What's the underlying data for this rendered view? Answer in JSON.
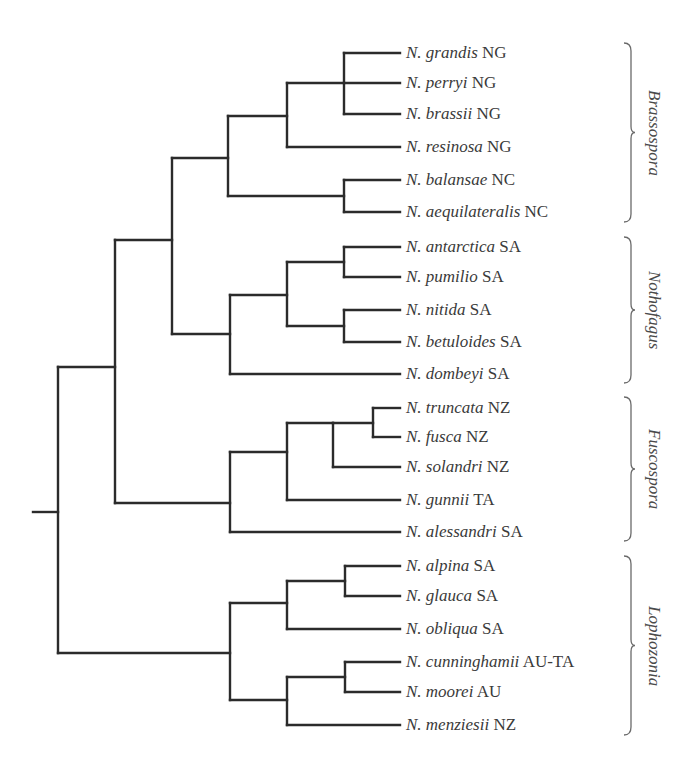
{
  "figure": {
    "type": "phylogenetic-tree",
    "genus_abbrev": "N."
  },
  "taxa": [
    {
      "species": "grandis",
      "region": "NG",
      "y": 53
    },
    {
      "species": "perryi",
      "region": "NG",
      "y": 83
    },
    {
      "species": "brassii",
      "region": "NG",
      "y": 114
    },
    {
      "species": "resinosa",
      "region": "NG",
      "y": 147
    },
    {
      "species": "balansae",
      "region": "NC",
      "y": 180
    },
    {
      "species": "aequilateralis",
      "region": "NC",
      "y": 212
    },
    {
      "species": "antarctica",
      "region": "SA",
      "y": 247
    },
    {
      "species": "pumilio",
      "region": "SA",
      "y": 277
    },
    {
      "species": "nitida",
      "region": "SA",
      "y": 310
    },
    {
      "species": "betuloides",
      "region": "SA",
      "y": 342
    },
    {
      "species": "dombeyi",
      "region": "SA",
      "y": 374
    },
    {
      "species": "truncata",
      "region": "NZ",
      "y": 408
    },
    {
      "species": "fusca",
      "region": "NZ",
      "y": 437
    },
    {
      "species": "solandri",
      "region": "NZ",
      "y": 467
    },
    {
      "species": "gunnii",
      "region": "TA",
      "y": 500
    },
    {
      "species": "alessandri",
      "region": "SA",
      "y": 532
    },
    {
      "species": "alpina",
      "region": "SA",
      "y": 566
    },
    {
      "species": "glauca",
      "region": "SA",
      "y": 596
    },
    {
      "species": "obliqua",
      "region": "SA",
      "y": 629
    },
    {
      "species": "cunninghamii",
      "region": "AU-TA",
      "y": 662
    },
    {
      "species": "moorei",
      "region": "AU",
      "y": 692
    },
    {
      "species": "menziesii",
      "region": "NZ",
      "y": 725
    }
  ],
  "groups": [
    {
      "name": "Brassospora",
      "top": 43,
      "bottom": 222
    },
    {
      "name": "Nothofagus",
      "top": 237,
      "bottom": 383
    },
    {
      "name": "Fuscospora",
      "top": 397,
      "bottom": 541
    },
    {
      "name": "Lophozonia",
      "top": 556,
      "bottom": 735
    }
  ],
  "branches": [
    [
      33,
      512,
      58,
      512
    ],
    [
      58,
      367,
      58,
      653
    ],
    [
      58,
      367,
      115,
      367
    ],
    [
      58,
      653,
      230,
      653
    ],
    [
      115,
      240,
      115,
      503
    ],
    [
      115,
      240,
      172,
      240
    ],
    [
      115,
      503,
      230,
      503
    ],
    [
      172,
      158,
      172,
      334
    ],
    [
      172,
      158,
      228,
      158
    ],
    [
      172,
      334,
      230,
      334
    ],
    [
      228,
      116,
      228,
      196
    ],
    [
      228,
      116,
      287,
      116
    ],
    [
      228,
      196,
      344,
      196
    ],
    [
      287,
      83,
      287,
      147
    ],
    [
      287,
      83,
      344,
      83
    ],
    [
      287,
      147,
      400,
      147
    ],
    [
      344,
      53,
      344,
      114
    ],
    [
      344,
      53,
      400,
      53
    ],
    [
      344,
      83,
      400,
      83
    ],
    [
      344,
      114,
      400,
      114
    ],
    [
      344,
      180,
      344,
      212
    ],
    [
      344,
      180,
      400,
      180
    ],
    [
      344,
      212,
      400,
      212
    ],
    [
      230,
      295,
      230,
      374
    ],
    [
      230,
      295,
      287,
      295
    ],
    [
      230,
      374,
      400,
      374
    ],
    [
      287,
      262,
      287,
      326
    ],
    [
      287,
      262,
      344,
      262
    ],
    [
      287,
      326,
      344,
      326
    ],
    [
      344,
      247,
      344,
      277
    ],
    [
      344,
      247,
      400,
      247
    ],
    [
      344,
      277,
      400,
      277
    ],
    [
      344,
      310,
      344,
      342
    ],
    [
      344,
      310,
      400,
      310
    ],
    [
      344,
      342,
      400,
      342
    ],
    [
      230,
      452,
      230,
      532
    ],
    [
      230,
      452,
      287,
      452
    ],
    [
      230,
      532,
      400,
      532
    ],
    [
      287,
      423,
      287,
      500
    ],
    [
      287,
      423,
      333,
      423
    ],
    [
      287,
      500,
      400,
      500
    ],
    [
      333,
      423,
      333,
      467
    ],
    [
      333,
      423,
      373,
      423
    ],
    [
      333,
      467,
      400,
      467
    ],
    [
      373,
      408,
      373,
      437
    ],
    [
      373,
      408,
      400,
      408
    ],
    [
      373,
      437,
      400,
      437
    ],
    [
      230,
      603,
      230,
      700
    ],
    [
      230,
      603,
      287,
      603
    ],
    [
      230,
      700,
      287,
      700
    ],
    [
      287,
      581,
      287,
      629
    ],
    [
      287,
      581,
      345,
      581
    ],
    [
      287,
      629,
      400,
      629
    ],
    [
      345,
      566,
      345,
      596
    ],
    [
      345,
      566,
      400,
      566
    ],
    [
      345,
      596,
      400,
      596
    ],
    [
      287,
      677,
      287,
      725
    ],
    [
      287,
      677,
      345,
      677
    ],
    [
      287,
      725,
      400,
      725
    ],
    [
      345,
      662,
      345,
      692
    ],
    [
      345,
      662,
      400,
      662
    ],
    [
      345,
      692,
      400,
      692
    ]
  ]
}
